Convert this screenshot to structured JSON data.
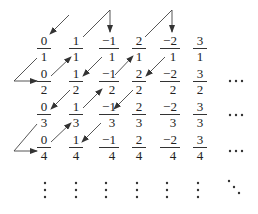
{
  "diagram": {
    "columns_x": [
      44,
      76,
      109,
      139,
      170,
      200
    ],
    "rows_y": [
      47,
      80,
      113,
      146
    ],
    "numerators": [
      "0",
      "1",
      "−1",
      "2",
      "−2",
      "3"
    ],
    "denominators": [
      "1",
      "2",
      "3",
      "4"
    ],
    "grid": [
      [
        {
          "num": "0",
          "den": "1"
        },
        {
          "num": "1",
          "den": "1"
        },
        {
          "num": "−1",
          "den": "1"
        },
        {
          "num": "2",
          "den": "1"
        },
        {
          "num": "−2",
          "den": "1"
        },
        {
          "num": "3",
          "den": "1"
        }
      ],
      [
        {
          "num": "0",
          "den": "2"
        },
        {
          "num": "1",
          "den": "2"
        },
        {
          "num": "−1",
          "den": "2"
        },
        {
          "num": "2",
          "den": "2"
        },
        {
          "num": "−2",
          "den": "2"
        },
        {
          "num": "3",
          "den": "2"
        }
      ],
      [
        {
          "num": "0",
          "den": "3"
        },
        {
          "num": "1",
          "den": "3"
        },
        {
          "num": "−1",
          "den": "3"
        },
        {
          "num": "2",
          "den": "3"
        },
        {
          "num": "−2",
          "den": "3"
        },
        {
          "num": "3",
          "den": "3"
        }
      ],
      [
        {
          "num": "0",
          "den": "4"
        },
        {
          "num": "1",
          "den": "4"
        },
        {
          "num": "−1",
          "den": "4"
        },
        {
          "num": "2",
          "den": "4"
        },
        {
          "num": "−2",
          "den": "4"
        },
        {
          "num": "3",
          "den": "4"
        }
      ]
    ],
    "row_ellipsis": "···",
    "col_ellipsis": "⋮",
    "diag_ellipsis": "⋱",
    "path_order": [
      "0/1",
      "0/2",
      "1/1",
      "−1/1",
      "1/2",
      "0/3",
      "0/4",
      "1/3",
      "−1/2",
      "2/1",
      "−2/1",
      "2/2",
      "−1/3",
      "1/4"
    ],
    "colors": {
      "ink": "#222222",
      "arrow": "#333333"
    }
  }
}
